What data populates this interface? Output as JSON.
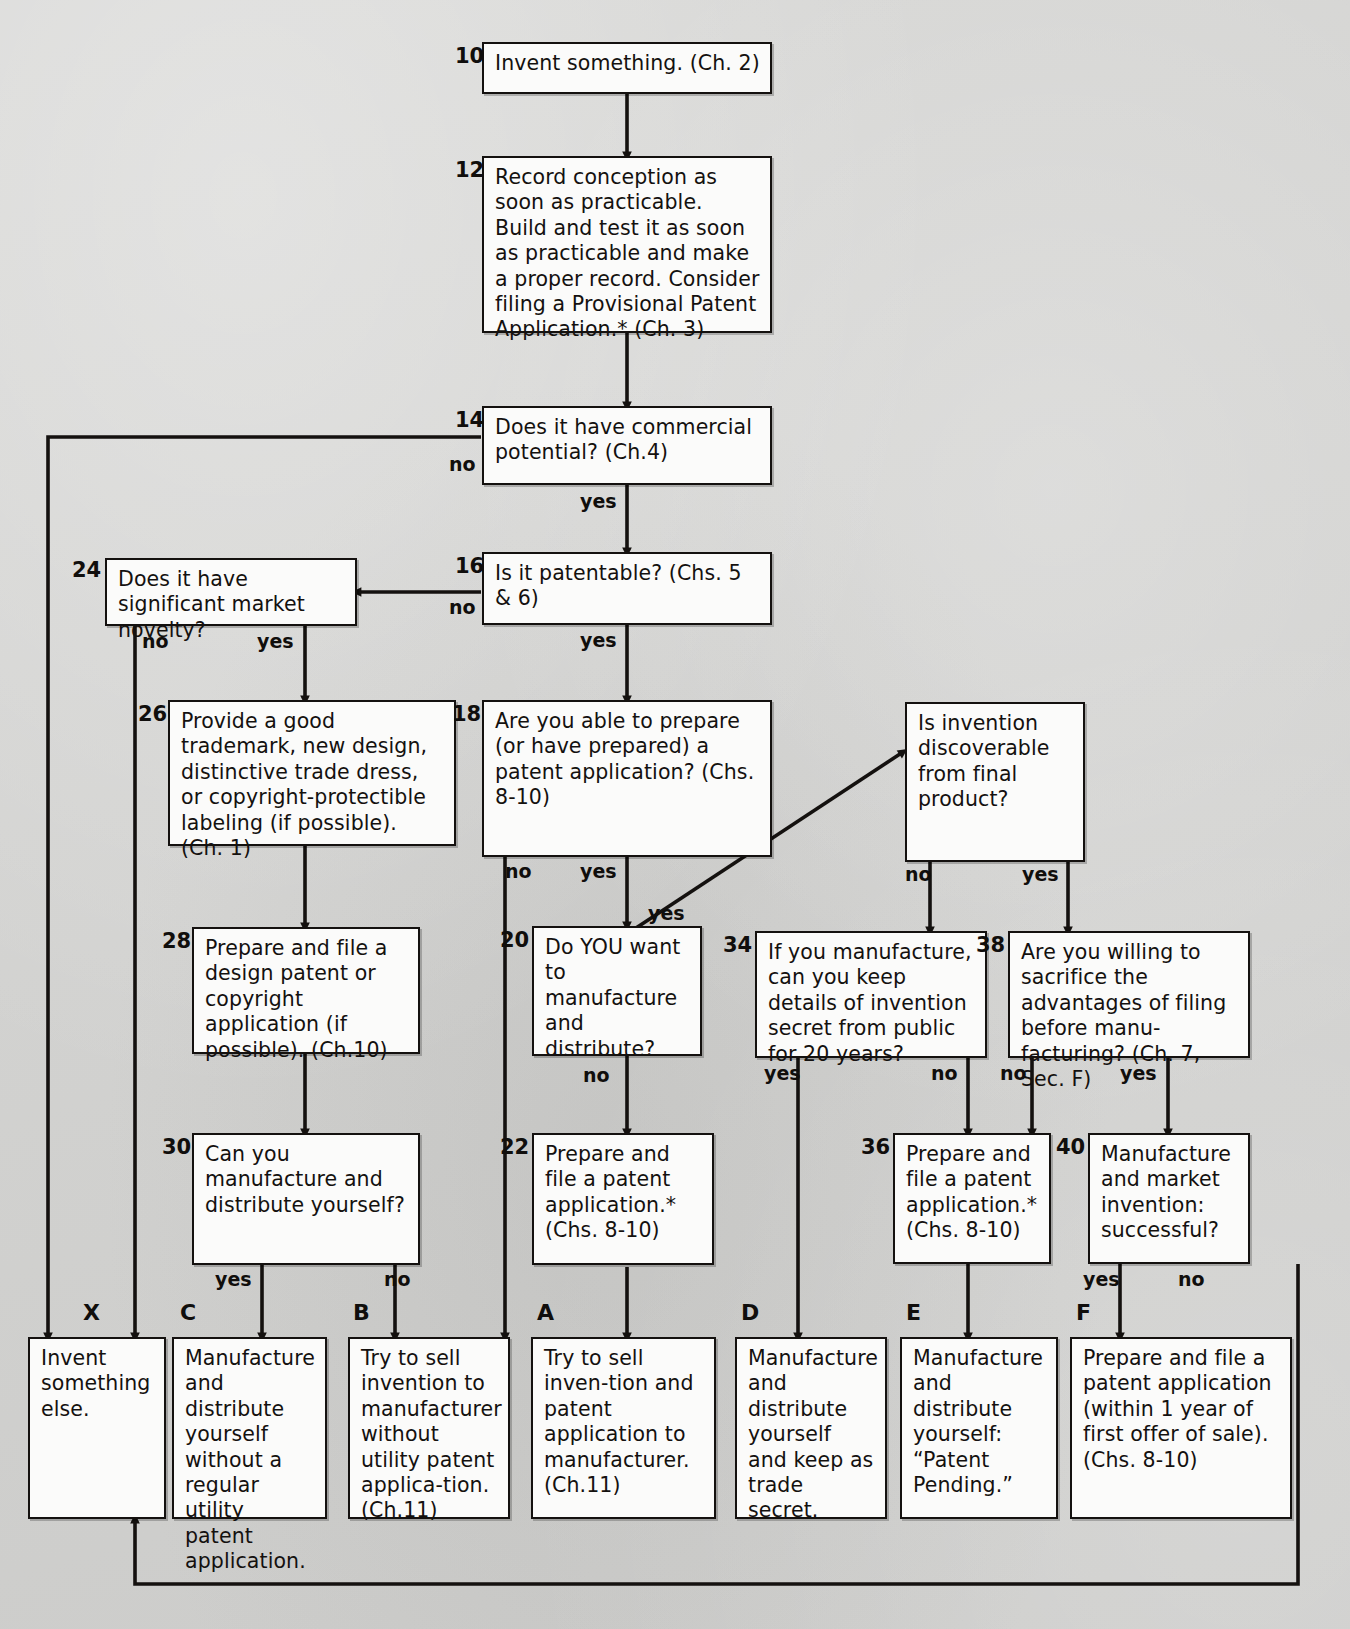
{
  "diagram": {
    "footnote_marker": "*",
    "colors": {
      "ink": "#14110f",
      "box_fill": "#fbfbfa",
      "page": "#d4d4d2"
    }
  },
  "nodes": [
    {
      "id": "n10",
      "number": "10",
      "text": "Invent something. (Ch. 2)"
    },
    {
      "id": "n12",
      "number": "12",
      "text": "Record conception as soon as practicable. Build and test it as soon as practicable and make a proper record. Consider filing a Provisional Patent Application.* (Ch. 3)"
    },
    {
      "id": "n14",
      "number": "14",
      "text": "Does it have commercial potential? (Ch.4)"
    },
    {
      "id": "n16",
      "number": "16",
      "text": "Is it patentable? (Chs. 5 & 6)"
    },
    {
      "id": "n24",
      "number": "24",
      "text": "Does it have significant market novelty?"
    },
    {
      "id": "n26",
      "number": "26",
      "text": "Provide a good trademark, new design, distinctive trade dress, or copyright-protectible labeling (if possible). (Ch. 1)"
    },
    {
      "id": "n28",
      "number": "28",
      "text": "Prepare and file a design patent or copyright application (if possible). (Ch.10)"
    },
    {
      "id": "n30",
      "number": "30",
      "text": "Can you manufacture and distribute yourself?"
    },
    {
      "id": "n18",
      "number": "18",
      "text": "Are you able to prepare (or have prepared) a patent application? (Chs. 8-10)"
    },
    {
      "id": "n20",
      "number": "20",
      "text": "Do YOU want to manufacture and distribute?"
    },
    {
      "id": "n22",
      "number": "22",
      "text": "Prepare and file a patent application.* (Chs. 8-10)"
    },
    {
      "id": "ndisc",
      "number": "",
      "text": "Is invention discoverable from final product?"
    },
    {
      "id": "n34",
      "number": "34",
      "text": "If you manufacture, can you keep details of invention secret from public for 20 years?"
    },
    {
      "id": "n38",
      "number": "38",
      "text": "Are you willing to sacrifice the advantages of filing before manu-facturing? (Ch. 7, Sec. F)"
    },
    {
      "id": "n36",
      "number": "36",
      "text": "Prepare and file a patent application.* (Chs. 8-10)"
    },
    {
      "id": "n40",
      "number": "40",
      "text": "Manufacture and market invention: successful?"
    },
    {
      "id": "tX",
      "number": "X",
      "text": "Invent something else."
    },
    {
      "id": "tC",
      "number": "C",
      "text": "Manufacture and distribute yourself without a regular utility patent application."
    },
    {
      "id": "tB",
      "number": "B",
      "text": "Try to sell invention to manufacturer without utility patent applica-tion. (Ch.11)"
    },
    {
      "id": "tA",
      "number": "A",
      "text": "Try to sell inven-tion and patent application to manufacturer. (Ch.11)"
    },
    {
      "id": "tD",
      "number": "D",
      "text": "Manufacture and distribute yourself and keep as trade secret."
    },
    {
      "id": "tE",
      "number": "E",
      "text": "Manufacture and distribute yourself: “Patent Pending.”"
    },
    {
      "id": "tF",
      "number": "F",
      "text": "Prepare and file a patent application (within 1 year of first offer of sale). (Chs. 8-10)"
    }
  ],
  "edge_labels": [
    {
      "id": "e14no",
      "text": "no"
    },
    {
      "id": "e14yes",
      "text": "yes"
    },
    {
      "id": "e16no",
      "text": "no"
    },
    {
      "id": "e16yes",
      "text": "yes"
    },
    {
      "id": "e24no",
      "text": "no"
    },
    {
      "id": "e24yes",
      "text": "yes"
    },
    {
      "id": "e18no",
      "text": "no"
    },
    {
      "id": "e18yes",
      "text": "yes"
    },
    {
      "id": "e18yes2",
      "text": "yes"
    },
    {
      "id": "e20no",
      "text": "no"
    },
    {
      "id": "e30yes",
      "text": "yes"
    },
    {
      "id": "e30no",
      "text": "no"
    },
    {
      "id": "edno",
      "text": "no"
    },
    {
      "id": "edyes",
      "text": "yes"
    },
    {
      "id": "e34yes",
      "text": "yes"
    },
    {
      "id": "e34no",
      "text": "no"
    },
    {
      "id": "e38no",
      "text": "no"
    },
    {
      "id": "e38yes",
      "text": "yes"
    },
    {
      "id": "e40yes",
      "text": "yes"
    },
    {
      "id": "e40no",
      "text": "no"
    }
  ]
}
